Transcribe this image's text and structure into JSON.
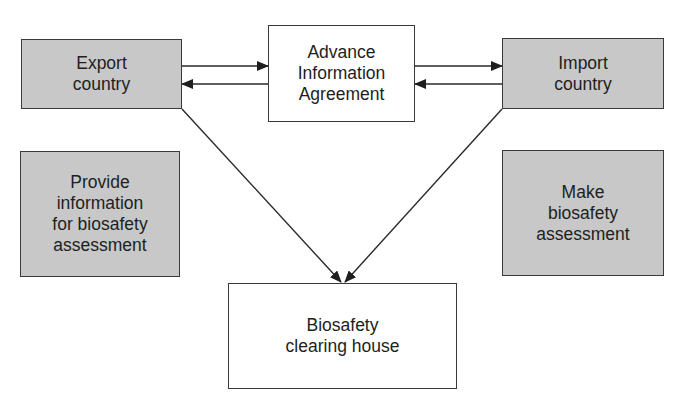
{
  "diagram": {
    "nodes": {
      "export_country": {
        "label": "Export\ncountry",
        "fill": "#c8c8c8"
      },
      "advance_information_agreement": {
        "label": "Advance\nInformation\nAgreement",
        "fill": "#ffffff"
      },
      "import_country": {
        "label": "Import\ncountry",
        "fill": "#c8c8c8"
      },
      "provide_information": {
        "label": "Provide\ninformation\nfor biosafety\nassessment",
        "fill": "#c8c8c8"
      },
      "make_assessment": {
        "label": "Make\nbiosafety\nassessment",
        "fill": "#c8c8c8"
      },
      "biosafety_clearing_house": {
        "label": "Biosafety\nclearing house",
        "fill": "#ffffff"
      }
    },
    "edges": [
      {
        "from": "Export country",
        "to": "Advance Information Agreement"
      },
      {
        "from": "Advance Information Agreement",
        "to": "Export country"
      },
      {
        "from": "Advance Information Agreement",
        "to": "Import country"
      },
      {
        "from": "Import country",
        "to": "Advance Information Agreement"
      },
      {
        "from": "Export country",
        "to": "Biosafety clearing house"
      },
      {
        "from": "Import country",
        "to": "Biosafety clearing house"
      }
    ]
  }
}
